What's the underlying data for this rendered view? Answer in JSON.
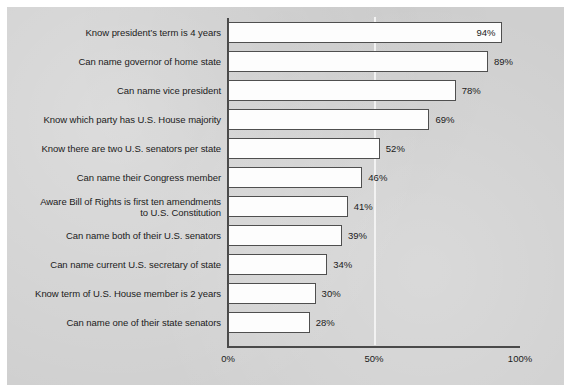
{
  "chart_data": {
    "type": "bar",
    "orientation": "horizontal",
    "title": "",
    "subtitle": "",
    "xlabel": "",
    "ylabel": "",
    "xlim": [
      0,
      100
    ],
    "grid": true,
    "gridlines": [
      50
    ],
    "legend": null,
    "value_suffix": "%",
    "tick_labels": [
      "0%",
      "50%",
      "100%"
    ],
    "tick_values": [
      0,
      50,
      100
    ],
    "categories": [
      "Know president’s term is 4 years",
      "Can name governor of home state",
      "Can name vice president",
      "Know which party has U.S. House majority",
      "Know there are two U.S. senators per state",
      "Can name their Congress member",
      "Aware Bill of Rights is first ten amendments to U.S. Constitution",
      "Can name both of their U.S. senators",
      "Can name current U.S. secretary of state",
      "Know term of U.S. House member is 2 years",
      "Can name one of their state senators"
    ],
    "values": [
      94,
      89,
      78,
      69,
      52,
      46,
      41,
      39,
      34,
      30,
      28
    ],
    "value_labels": [
      "94%",
      "89%",
      "78%",
      "69%",
      "52%",
      "46%",
      "41%",
      "39%",
      "34%",
      "30%",
      "28%"
    ],
    "rows": [
      {
        "label_line1": "Know president’s term is 4 years",
        "label_line2": "",
        "value": 94,
        "value_label": "94%",
        "label_placement": "inside"
      },
      {
        "label_line1": "Can name governor of home state",
        "label_line2": "",
        "value": 89,
        "value_label": "89%",
        "label_placement": "outside"
      },
      {
        "label_line1": "Can name vice president",
        "label_line2": "",
        "value": 78,
        "value_label": "78%",
        "label_placement": "outside"
      },
      {
        "label_line1": "Know which party has U.S. House majority",
        "label_line2": "",
        "value": 69,
        "value_label": "69%",
        "label_placement": "outside"
      },
      {
        "label_line1": "Know there are two U.S. senators per state",
        "label_line2": "",
        "value": 52,
        "value_label": "52%",
        "label_placement": "outside"
      },
      {
        "label_line1": "Can name their Congress member",
        "label_line2": "",
        "value": 46,
        "value_label": "46%",
        "label_placement": "outside"
      },
      {
        "label_line1": "Aware Bill of Rights is first ten amendments",
        "label_line2": "to U.S. Constitution",
        "value": 41,
        "value_label": "41%",
        "label_placement": "outside"
      },
      {
        "label_line1": "Can name both of their U.S. senators",
        "label_line2": "",
        "value": 39,
        "value_label": "39%",
        "label_placement": "outside"
      },
      {
        "label_line1": "Can name current U.S. secretary of state",
        "label_line2": "",
        "value": 34,
        "value_label": "34%",
        "label_placement": "outside"
      },
      {
        "label_line1": "Know term of U.S. House member is 2 years",
        "label_line2": "",
        "value": 30,
        "value_label": "30%",
        "label_placement": "outside"
      },
      {
        "label_line1": "Can name one of their state senators",
        "label_line2": "",
        "value": 28,
        "value_label": "28%",
        "label_placement": "outside"
      }
    ]
  },
  "colors": {
    "background": "#cfcfcf",
    "page": "#ffffff",
    "bar_fill": "#fdfdfd",
    "bar_border": "#4f4f4f",
    "axis": "#4a4a4a",
    "gridline": "#f2f2f2",
    "text": "#1b1b1b"
  }
}
